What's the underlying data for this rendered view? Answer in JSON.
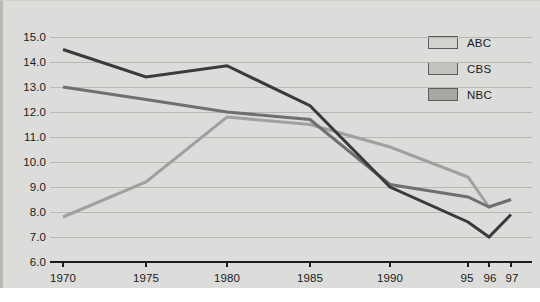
{
  "chart_data": {
    "type": "line",
    "title": "",
    "subtitle": "",
    "xlabel": "",
    "ylabel": "",
    "grid": true,
    "legend_position": "top-right",
    "x": [
      "1970",
      "1975",
      "1980",
      "1985",
      "1990",
      "95",
      "96",
      "97"
    ],
    "xtick_labels": [
      "1970",
      "1975",
      "1980",
      "1985",
      "1990",
      "95",
      "96",
      "97"
    ],
    "ytick_labels": [
      "15.0",
      "14.0",
      "13.0",
      "12.0",
      "11.0",
      "10.0",
      "9.0",
      "8.0",
      "7.0",
      "6.0"
    ],
    "ylim": [
      6.0,
      15.0
    ],
    "ystep": 1.0,
    "series": [
      {
        "name": "ABC",
        "color": "#a0a09e",
        "values": [
          7.8,
          9.2,
          11.8,
          11.5,
          10.6,
          9.4,
          8.2,
          8.5
        ]
      },
      {
        "name": "CBS",
        "color": "#6f6f6f",
        "values": [
          13.0,
          12.5,
          12.0,
          11.7,
          9.1,
          8.6,
          8.2,
          8.5
        ]
      },
      {
        "name": "NBC",
        "color": "#3a3a3a",
        "values": [
          14.5,
          13.4,
          13.85,
          12.25,
          9.0,
          7.6,
          7.0,
          7.9
        ]
      }
    ]
  },
  "legend": {
    "items": [
      {
        "label": "ABC",
        "swatch_color": "#d2d2cf"
      },
      {
        "label": "CBS",
        "swatch_color": "#c2c2bf"
      },
      {
        "label": "NBC",
        "swatch_color": "#a6a6a3"
      }
    ]
  },
  "colors": {
    "plot_background": "#dcdcda",
    "gridline": "#b7b7b4",
    "axis": "#1b1b1b",
    "text": "#1b1b1b"
  }
}
